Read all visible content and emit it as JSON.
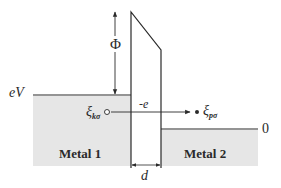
{
  "diagram": {
    "type": "tunnel-junction-energy-diagram",
    "labels": {
      "barrier_height": "Φ",
      "bias_level": "eV",
      "zero_level": "0",
      "charge": "-e",
      "width": "d",
      "metal_left": "Metal 1",
      "metal_right": "Metal 2",
      "state_left_symbol": "ξ",
      "state_left_sub": "kσ",
      "state_right_symbol": "ξ",
      "state_right_sub": "pσ"
    },
    "colors": {
      "line": "#2a2a2a",
      "metal_fill": "#e6e6e6",
      "background": "#ffffff"
    }
  }
}
